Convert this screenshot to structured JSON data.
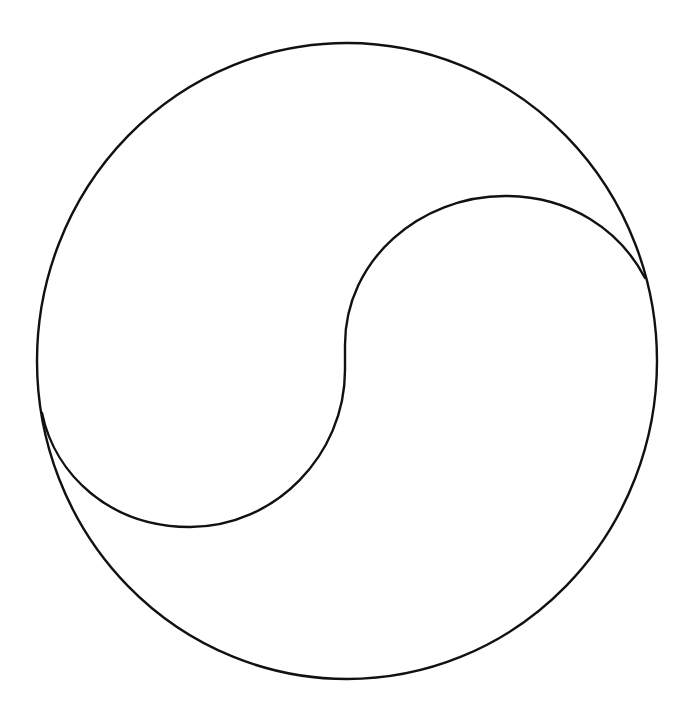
{
  "diagram": {
    "type": "yin-yang-outline",
    "background": "#ffffff",
    "stroke_color": "#111111",
    "stroke_width": 2.4,
    "outer_circle": {
      "cx": 347,
      "cy": 361,
      "rx": 310,
      "ry": 318
    },
    "s_curve": {
      "start": [
        645,
        278
      ],
      "end": [
        42,
        413
      ],
      "upper_lobe_top": [
        505,
        196
      ],
      "lower_lobe_bottom": [
        190,
        527
      ],
      "inner_point": [
        345,
        360
      ]
    }
  }
}
